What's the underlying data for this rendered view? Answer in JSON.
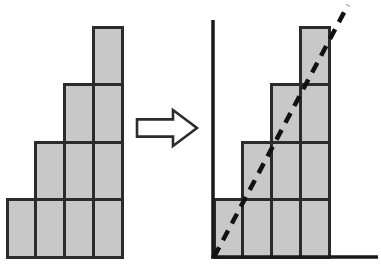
{
  "figure": {
    "canvas": {
      "width": 381,
      "height": 269,
      "background": "#ffffff"
    },
    "colors": {
      "block_fill": "#c8c8c8",
      "block_stroke": "#2b2b2b",
      "axis": "#1a1a1a",
      "trend_line": "#111111",
      "arrow_fill": "#ffffff",
      "arrow_stroke": "#2b2b2b"
    },
    "geometry": {
      "cell_width": 28.75,
      "cell_height": 57.5,
      "stroke_width": 3,
      "axis_stroke_width": 3.5,
      "trend_dash": "11 8",
      "trend_width": 4.5
    },
    "left_figure": {
      "name": "staircase-blocks",
      "origin_x": 7,
      "baseline_y": 257,
      "column_heights": [
        1,
        2,
        3,
        4
      ],
      "column_count": 4,
      "max_height": 4
    },
    "arrow": {
      "name": "transformation-arrow",
      "label": "implies",
      "x": 137,
      "y": 110,
      "width": 60,
      "height": 36
    },
    "right_figure": {
      "name": "staircase-plot",
      "origin_x": 214,
      "baseline_y": 257,
      "column_heights": [
        1,
        2,
        3,
        4
      ],
      "column_count": 4,
      "max_height": 4,
      "y_axis": {
        "x": 213,
        "top_y": 20,
        "bottom_y": 258
      },
      "x_axis": {
        "y": 257,
        "left_x": 211,
        "right_x": 378
      },
      "trend_line": {
        "label": "linear trend",
        "x1": 214,
        "y1": 257,
        "x2": 348,
        "y2": 5
      }
    }
  },
  "chart_data": {
    "type": "bar",
    "title": "",
    "xlabel": "",
    "ylabel": "",
    "categories": [
      "1",
      "2",
      "3",
      "4"
    ],
    "values": [
      1,
      2,
      3,
      4
    ],
    "ylim": [
      0,
      4.4
    ],
    "grid": false,
    "legend": "none",
    "annotations": [
      {
        "type": "line",
        "style": "dashed",
        "from": [
          0,
          0
        ],
        "to": [
          4.66,
          4.38
        ],
        "label": "trend"
      },
      {
        "type": "arrow",
        "label": "implies",
        "direction": "right"
      }
    ],
    "series": [
      {
        "name": "blocks",
        "values": [
          1,
          2,
          3,
          4
        ]
      }
    ]
  }
}
